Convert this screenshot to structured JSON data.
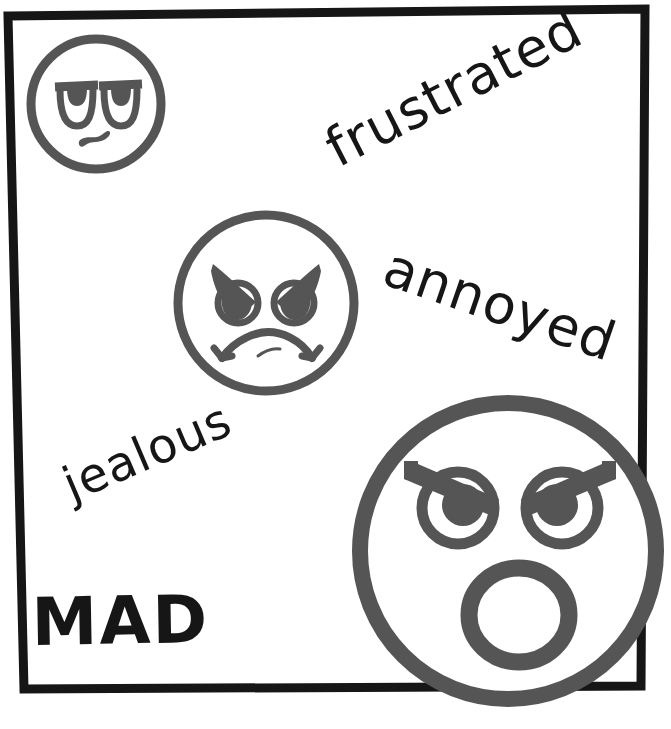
{
  "poster": {
    "title": "MAD",
    "width": 671,
    "height": 729,
    "background_color": "#ffffff",
    "frame_color": "#161616",
    "ink_color": "#555555",
    "text_color": "#161616"
  },
  "labels": {
    "main": "MAD",
    "frustrated": "frustrated",
    "annoyed": "annoyed",
    "jealous": "jealous"
  },
  "faces": [
    {
      "id": "face-small",
      "name": "unamused-face",
      "expression": "unamused",
      "cx": 96,
      "cy": 104,
      "r": 68,
      "stroke": 9
    },
    {
      "id": "face-medium",
      "name": "angry-frowning-face",
      "expression": "angry-frown",
      "cx": 266,
      "cy": 303,
      "r": 92,
      "stroke": 9
    },
    {
      "id": "face-large",
      "name": "shouting-angry-face",
      "expression": "shouting-angry",
      "cx": 508,
      "cy": 551,
      "r": 148,
      "stroke": 16
    }
  ],
  "text_placements": [
    {
      "key": "frustrated",
      "x": 338,
      "y": 168,
      "rotation": -27
    },
    {
      "key": "annoyed",
      "x": 380,
      "y": 283,
      "rotation": 19
    },
    {
      "key": "jealous",
      "x": 72,
      "y": 502,
      "rotation": -23
    },
    {
      "key": "mad",
      "x": 32,
      "y": 645,
      "rotation": -1
    }
  ]
}
